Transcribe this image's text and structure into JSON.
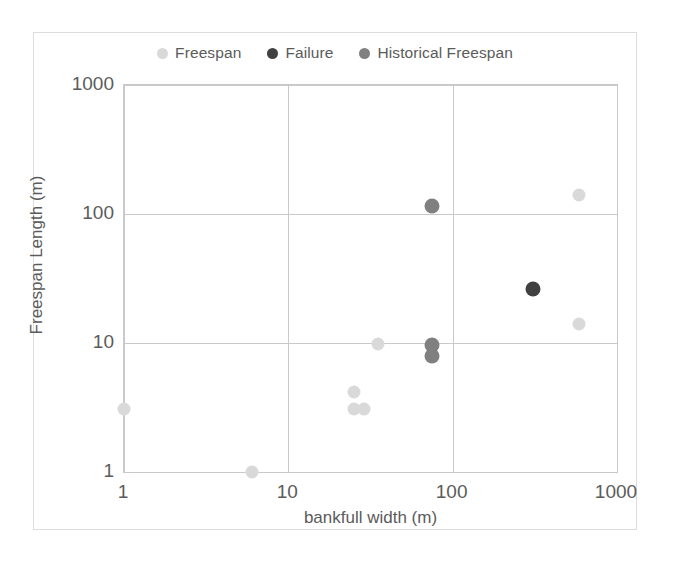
{
  "chart_data": {
    "type": "scatter",
    "title": "",
    "xlabel": "bankfull width (m)",
    "ylabel": "Freespan Length (m)",
    "xscale": "log",
    "yscale": "log",
    "xlim": [
      1,
      1000
    ],
    "ylim": [
      1,
      1000
    ],
    "xticks": [
      "1",
      "10",
      "100",
      "1000"
    ],
    "yticks": [
      "1000",
      "100",
      "10",
      "1"
    ],
    "grid": true,
    "legend_position": "top",
    "series": [
      {
        "name": "Freespan",
        "color": "#d9d9d9",
        "marker": "circle",
        "points": [
          {
            "x": 1,
            "y": 3.1
          },
          {
            "x": 6,
            "y": 1.0
          },
          {
            "x": 25,
            "y": 4.2
          },
          {
            "x": 25,
            "y": 3.1
          },
          {
            "x": 29,
            "y": 3.1
          },
          {
            "x": 35,
            "y": 9.8
          },
          {
            "x": 590,
            "y": 140
          },
          {
            "x": 590,
            "y": 14
          }
        ]
      },
      {
        "name": "Failure",
        "color": "#404040",
        "marker": "circle",
        "points": [
          {
            "x": 310,
            "y": 26
          }
        ]
      },
      {
        "name": "Historical Freespan",
        "color": "#808080",
        "marker": "circle",
        "points": [
          {
            "x": 75,
            "y": 115
          },
          {
            "x": 75,
            "y": 9.6
          },
          {
            "x": 75,
            "y": 7.9
          }
        ]
      }
    ]
  },
  "legend": {
    "items": [
      {
        "label": "Freespan",
        "color": "#d9d9d9"
      },
      {
        "label": "Failure",
        "color": "#404040"
      },
      {
        "label": "Historical Freespan",
        "color": "#808080"
      }
    ]
  },
  "axes": {
    "x_title": "bankfull width (m)",
    "y_title": "Freespan Length (m)",
    "x_tick_labels": [
      "1",
      "10",
      "100",
      "1000"
    ],
    "y_tick_labels": [
      "1000",
      "100",
      "10",
      "1"
    ]
  }
}
